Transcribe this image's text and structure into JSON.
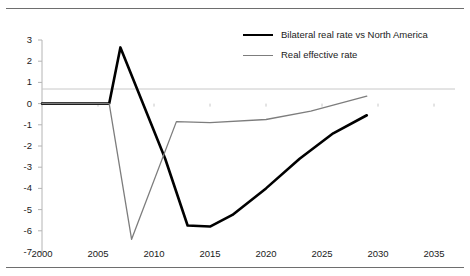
{
  "chart_data": {
    "type": "line",
    "title": "",
    "subtitle": "",
    "xlabel": "",
    "ylabel": "",
    "xlim": [
      2000,
      2035
    ],
    "ylim": [
      -7,
      3
    ],
    "grid": false,
    "legend_position": "top-right",
    "x_ticks": [
      2000,
      2005,
      2010,
      2015,
      2020,
      2025,
      2030,
      2035
    ],
    "y_ticks": [
      3,
      2,
      1,
      0,
      -1,
      -2,
      -3,
      -4,
      -5,
      -6,
      -7
    ],
    "zero_line": 0,
    "series": [
      {
        "name": "Bilateral real rate vs North America",
        "color": "#000000",
        "width": 2.6,
        "x": [
          2000,
          2003,
          2006,
          2007,
          2011,
          2013,
          2015,
          2017,
          2020,
          2023,
          2026,
          2029
        ],
        "values": [
          0,
          0,
          0,
          2.65,
          -2.6,
          -5.75,
          -5.8,
          -5.25,
          -4.0,
          -2.6,
          -1.4,
          -0.55
        ]
      },
      {
        "name": "Real effective rate",
        "color": "#7d7d7d",
        "width": 1.3,
        "x": [
          2000,
          2003,
          2006,
          2008,
          2012,
          2015,
          2020,
          2024,
          2029
        ],
        "values": [
          0,
          0,
          0,
          -6.4,
          -0.85,
          -0.9,
          -0.75,
          -0.35,
          0.35
        ]
      }
    ]
  },
  "axes": {
    "y_labels": [
      "3",
      "2",
      "1",
      "0",
      "-1",
      "-2",
      "-3",
      "-4",
      "-5",
      "-6",
      "-7"
    ],
    "x_labels": [
      "2000",
      "2005",
      "2010",
      "2015",
      "2020",
      "2025",
      "2030",
      "2035"
    ]
  },
  "legend": {
    "items": [
      {
        "label": "Bilateral real rate vs North America"
      },
      {
        "label": "Real effective rate"
      }
    ]
  }
}
